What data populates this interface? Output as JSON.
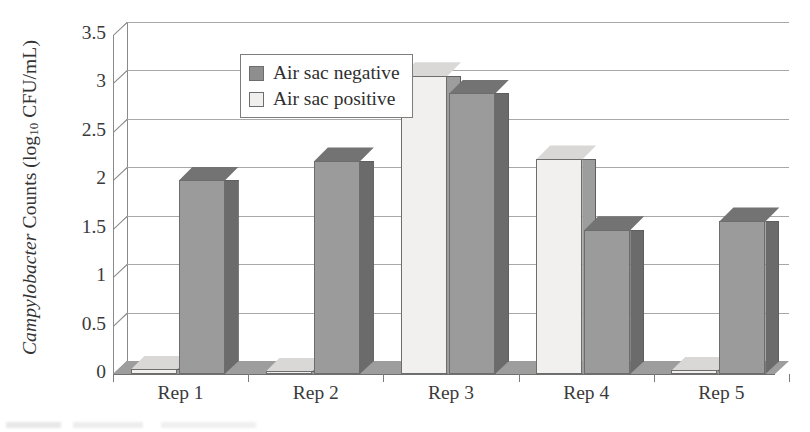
{
  "chart_data": {
    "type": "bar",
    "title": "",
    "subtitle": "",
    "xlabel": "",
    "ylabel": "Campylobacter Counts (log10 CFU/mL)",
    "ylabel_parts": {
      "italic": "Campylobacter",
      "rest_before_sub": " Counts (log",
      "subscript": "10",
      "rest_after_sub": " CFU/mL)"
    },
    "categories": [
      "Rep 1",
      "Rep 2",
      "Rep 3",
      "Rep 4",
      "Rep 5"
    ],
    "series": [
      {
        "name": "Air sac positive",
        "color": "#f1f0ee",
        "values": [
          0.05,
          0.03,
          3.08,
          2.22,
          0.04
        ]
      },
      {
        "name": "Air sac negative",
        "color": "#9b9b9b",
        "values": [
          2.0,
          2.2,
          2.9,
          1.49,
          1.58
        ]
      }
    ],
    "ylim": [
      0,
      3.5
    ],
    "ytick_values": [
      0,
      0.5,
      1,
      1.5,
      2,
      2.5,
      3,
      3.5
    ],
    "ytick_labels": [
      "0",
      "0.5",
      "1",
      "1.5",
      "2",
      "2.5",
      "3",
      "3.5"
    ],
    "grid": true,
    "grid_axis": "y",
    "legend_position": "upper-left-inside",
    "style": "3d-column",
    "legend_order": [
      "Air sac negative",
      "Air sac positive"
    ]
  },
  "legend": {
    "items": [
      {
        "label": "Air sac negative",
        "swatch": "dark-gray-swatch"
      },
      {
        "label": "Air sac positive",
        "swatch": "white-swatch"
      }
    ]
  },
  "colors": {
    "series_negative_front": "#9b9b9b",
    "series_negative_side": "#6b6b6b",
    "series_positive_front": "#f1f0ee",
    "series_positive_side": "#9d9d9d",
    "gridline": "#a8a8a8",
    "axis": "#8a8a8a",
    "floor": "#9d9d9d",
    "text": "#2f2f2f"
  }
}
